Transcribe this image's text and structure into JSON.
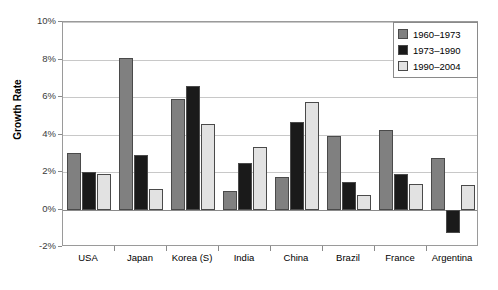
{
  "chart_data": {
    "type": "bar",
    "title": "",
    "xlabel": "",
    "ylabel": "Growth Rate",
    "ylim": [
      -2,
      10
    ],
    "ytick_values": [
      10,
      8,
      6,
      4,
      2,
      0,
      -2
    ],
    "ytick_labels": [
      "10%",
      "8%",
      "6%",
      "4%",
      "2%",
      "0%",
      "-2%"
    ],
    "grid": true,
    "legend_position": "top-right",
    "categories": [
      "USA",
      "Japan",
      "Korea (S)",
      "India",
      "China",
      "Brazil",
      "France",
      "Argentina"
    ],
    "series": [
      {
        "name": "1960–1973",
        "color": "#808080",
        "values": [
          3.0,
          8.1,
          5.9,
          1.0,
          1.75,
          3.9,
          4.25,
          2.75
        ]
      },
      {
        "name": "1973–1990",
        "color": "#1a1a1a",
        "values": [
          2.0,
          2.9,
          6.6,
          2.5,
          4.65,
          1.45,
          1.9,
          -1.25
        ]
      },
      {
        "name": "1990–2004",
        "color": "#e2e2e2",
        "values": [
          1.9,
          1.1,
          4.55,
          3.35,
          5.75,
          0.75,
          1.35,
          1.3
        ]
      }
    ]
  }
}
